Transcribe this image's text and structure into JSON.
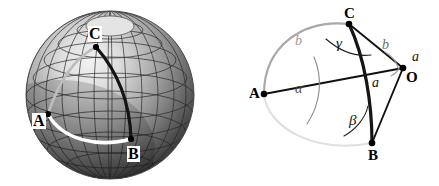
{
  "figure": {
    "background_color": "#ffffff",
    "panels": [
      {
        "id": "sphere",
        "caption": "Shaded globe with latitude-longitude grid"
      },
      {
        "id": "triangle",
        "caption": "Spherical triangle ABC with centre O"
      }
    ]
  },
  "sphere_panel": {
    "vertices": [
      {
        "name": "C",
        "label": "C",
        "x": 96,
        "y": 47
      },
      {
        "name": "A",
        "label": "A",
        "x": 48,
        "y": 114
      },
      {
        "name": "B",
        "label": "B",
        "x": 131,
        "y": 139
      }
    ],
    "arcs": [
      {
        "name": "arc-C-B",
        "color": "#1a1a1a",
        "style": "solid"
      },
      {
        "name": "arc-A-B",
        "color": "#ffffff",
        "style": "solid"
      },
      {
        "name": "arc-A-C",
        "color": "#b5b5b5",
        "style": "solid"
      }
    ],
    "grid": {
      "meridians": 24,
      "parallels": 9,
      "grid_color": "#2b2b2b"
    },
    "shading": {
      "highlight": "#e8e8e8",
      "midtone": "#9a9a9a",
      "shadow": "#3a3a3a"
    },
    "pole_cap_color": "#dcdcdc"
  },
  "triangle_panel": {
    "vertices": [
      {
        "name": "C",
        "label": "C",
        "x": 134,
        "y": 24
      },
      {
        "name": "O",
        "label": "O",
        "x": 188,
        "y": 68
      },
      {
        "name": "A",
        "label": "A",
        "x": 49,
        "y": 94
      },
      {
        "name": "B",
        "label": "B",
        "x": 157,
        "y": 143
      }
    ],
    "angle_labels": [
      {
        "name": "alpha",
        "label": "α",
        "x": 83,
        "y": 88,
        "color": "#4a4a4a"
      },
      {
        "name": "beta",
        "label": "β",
        "x": 140,
        "y": 120,
        "color": "#1a1a1a"
      },
      {
        "name": "gamma",
        "label": "γ",
        "x": 125,
        "y": 43,
        "color": "#1a1a1a"
      }
    ],
    "side_labels": [
      {
        "name": "b-upper-left",
        "label": "b",
        "x": 84,
        "y": 42,
        "color": "#9a9a9a"
      },
      {
        "name": "b-right",
        "label": "b",
        "x": 170,
        "y": 45,
        "color": "#6e6e6e"
      },
      {
        "name": "a-centre",
        "label": "a",
        "x": 160,
        "y": 83,
        "color": "#1a1a1a"
      },
      {
        "name": "a-at-O",
        "label": "a",
        "x": 199,
        "y": 57,
        "color": "#1a1a1a"
      }
    ],
    "edges": [
      {
        "name": "segment-A-O",
        "from": "A",
        "to": "O",
        "color": "#111111",
        "kind": "straight"
      },
      {
        "name": "segment-C-O",
        "from": "C",
        "to": "O",
        "color": "#111111",
        "kind": "straight"
      },
      {
        "name": "segment-B-O",
        "from": "B",
        "to": "O",
        "color": "#111111",
        "kind": "straight"
      },
      {
        "name": "arc-C-B",
        "from": "C",
        "to": "B",
        "color": "#1a1a1a",
        "kind": "arc"
      },
      {
        "name": "arc-A-C",
        "from": "A",
        "to": "C",
        "color": "#9a9a9a",
        "kind": "arc"
      },
      {
        "name": "arc-A-B",
        "from": "A",
        "to": "B",
        "color": "#dcdcdc",
        "kind": "arc"
      }
    ]
  }
}
